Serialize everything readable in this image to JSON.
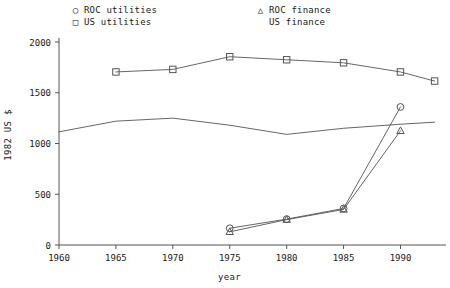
{
  "legend": {
    "entries": [
      {
        "marker": "circle",
        "glyph": "○",
        "label": "ROC utilities",
        "column": "left",
        "row": 1
      },
      {
        "marker": "square",
        "glyph": "□",
        "label": "US utilities",
        "column": "left",
        "row": 2
      },
      {
        "marker": "triangle",
        "glyph": "△",
        "label": "ROC finance",
        "column": "right",
        "row": 1
      },
      {
        "marker": "none",
        "glyph": "",
        "label": "US finance",
        "column": "right",
        "row": 2
      }
    ]
  },
  "axes": {
    "y_label": "1982 US $",
    "x_label": "year",
    "y_ticks": [
      "0",
      "500",
      "1000",
      "1500",
      "2000"
    ],
    "x_ticks": [
      "1960",
      "1965",
      "1970",
      "1975",
      "1980",
      "1985",
      "1990"
    ]
  },
  "colors": {
    "line": "#555555",
    "axis": "#555555",
    "text": "#1a1a1a",
    "background": "#ffffff"
  },
  "chart_data": {
    "type": "line",
    "title": "",
    "xlabel": "year",
    "ylabel": "1982 US $",
    "xlim": [
      1960,
      1994
    ],
    "ylim": [
      0,
      2100
    ],
    "grid": false,
    "legend_position": "top",
    "x_ticks": [
      1960,
      1965,
      1970,
      1975,
      1980,
      1985,
      1990
    ],
    "y_ticks": [
      0,
      500,
      1000,
      1500,
      2000
    ],
    "series": [
      {
        "name": "ROC utilities",
        "marker": "circle",
        "x": [
          1975,
          1980,
          1985,
          1990
        ],
        "values": [
          165,
          255,
          360,
          1360
        ]
      },
      {
        "name": "US utilities",
        "marker": "square",
        "x": [
          1965,
          1970,
          1975,
          1980,
          1985,
          1990,
          1993
        ],
        "values": [
          1705,
          1730,
          1855,
          1825,
          1795,
          1705,
          1615
        ]
      },
      {
        "name": "ROC finance",
        "marker": "triangle",
        "x": [
          1975,
          1980,
          1985,
          1990
        ],
        "values": [
          130,
          250,
          350,
          1125
        ]
      },
      {
        "name": "US finance",
        "marker": "none",
        "x": [
          1960,
          1965,
          1970,
          1975,
          1980,
          1985,
          1990,
          1993
        ],
        "values": [
          1115,
          1220,
          1250,
          1180,
          1090,
          1150,
          1190,
          1210
        ]
      }
    ]
  }
}
